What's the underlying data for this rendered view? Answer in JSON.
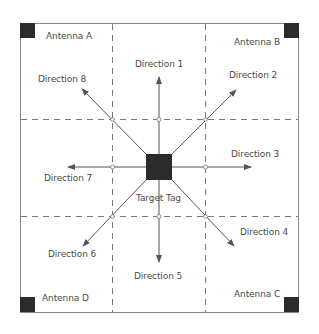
{
  "diagram": {
    "type": "rfid-antenna-layout",
    "colors": {
      "background": "#ffffff",
      "frame": "#8a8a8a",
      "grid_dash": "#7a7a7a",
      "arrow": "#555555",
      "square": "#2b2b2b",
      "text": "#4a4a4a"
    },
    "antennas": [
      {
        "label": "Antenna A",
        "corner": "top-left"
      },
      {
        "label": "Antenna B",
        "corner": "top-right"
      },
      {
        "label": "Antenna C",
        "corner": "bottom-right"
      },
      {
        "label": "Antenna D",
        "corner": "bottom-left"
      }
    ],
    "target": {
      "label": "Target Tag"
    },
    "directions": [
      {
        "label": "Direction 1",
        "heading": "up"
      },
      {
        "label": "Direction 2",
        "heading": "up-right"
      },
      {
        "label": "Direction 3",
        "heading": "right"
      },
      {
        "label": "Direction 4",
        "heading": "down-right"
      },
      {
        "label": "Direction 5",
        "heading": "down"
      },
      {
        "label": "Direction 6",
        "heading": "down-left"
      },
      {
        "label": "Direction 7",
        "heading": "left"
      },
      {
        "label": "Direction 8",
        "heading": "up-left"
      }
    ]
  }
}
